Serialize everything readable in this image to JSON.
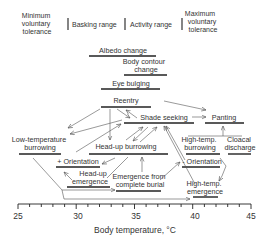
{
  "header": {
    "min_tolerance": [
      "Minimum",
      "voluntary",
      "tolerance"
    ],
    "basking_range": "Basking range",
    "activity_range": "Activity range",
    "max_tolerance": [
      "Maximum",
      "voluntary",
      "tolerance"
    ]
  },
  "nodes": {
    "albedo": "Albedo change",
    "body_contour": [
      "Body contour",
      "change"
    ],
    "eye_bulging": "Eye bulging",
    "reentry": "Reentry",
    "shade_seeking": "Shade seeking",
    "panting": "Panting",
    "low_temp_burrowing": [
      "Low-temperature",
      "burrowing"
    ],
    "head_up_burrowing": "Head-up burrowing",
    "high_temp_burrowing": [
      "High-temp.",
      "burrowing"
    ],
    "cloacal_discharge": [
      "Cloacal",
      "discharge"
    ],
    "plus_orientation": "+ Orientation",
    "minus_orientation": "- Orientation",
    "head_up_emergence": [
      "Head-up",
      "emergence"
    ],
    "emergence_complete_burial": [
      "Emergence from",
      "complete burial"
    ],
    "high_temp_emergence": [
      "High-temp.",
      "emergence"
    ]
  },
  "axis": {
    "title": "Body temperature, °C",
    "ticks": [
      "25",
      "30",
      "35",
      "40",
      "45"
    ],
    "min": 25,
    "max": 45
  },
  "colors": {
    "ink": "#222222",
    "text": "#333333",
    "arrow": "#555555"
  }
}
